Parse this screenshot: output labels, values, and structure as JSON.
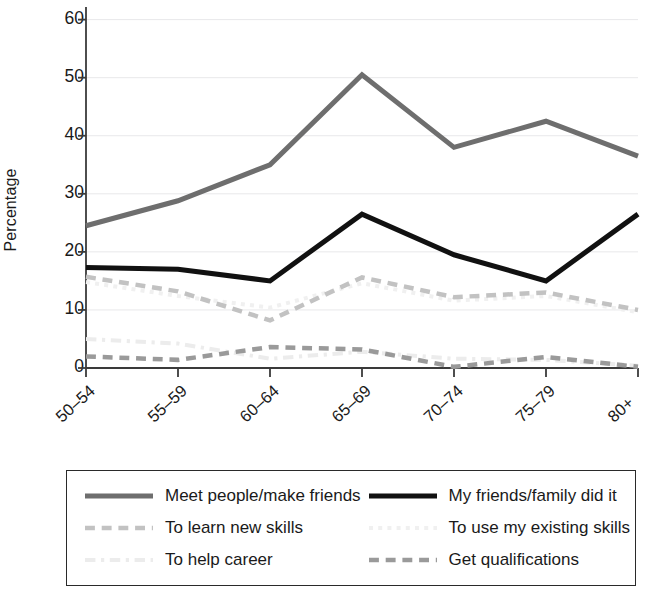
{
  "chart_data": {
    "type": "line",
    "title": "",
    "xlabel": "",
    "ylabel": "Percentage",
    "categories": [
      "50–54",
      "55–59",
      "60–64",
      "65–69",
      "70–74",
      "75–79",
      "80+"
    ],
    "ylim": [
      0,
      62
    ],
    "yticks": [
      0,
      10,
      20,
      30,
      40,
      50,
      60
    ],
    "ytick_labels": [
      "0",
      "10",
      "20",
      "30",
      "40",
      "50",
      "60"
    ],
    "grid": true,
    "grid_axis": "y",
    "legend_position": "bottom",
    "legend_columns": 2,
    "series": [
      {
        "name": "Meet people/make friends",
        "values": [
          24.5,
          28.8,
          35.0,
          50.5,
          38.0,
          42.5,
          36.5
        ],
        "color": "#6e6e6e",
        "style": "solid",
        "width": 5
      },
      {
        "name": "My friends/family did it",
        "values": [
          17.3,
          17.0,
          15.0,
          26.5,
          19.5,
          15.0,
          26.5
        ],
        "color": "#111111",
        "style": "solid",
        "width": 5
      },
      {
        "name": "To learn new skills",
        "values": [
          15.7,
          13.2,
          8.2,
          15.6,
          12.2,
          13.0,
          10.0
        ],
        "color": "#c2c2c2",
        "style": "dashed",
        "width": 4.5
      },
      {
        "name": "To use my existing skills",
        "values": [
          14.8,
          12.4,
          10.4,
          14.6,
          11.6,
          12.4,
          9.6
        ],
        "color": "#f0f0f0",
        "style": "dotted",
        "width": 4
      },
      {
        "name": "To help career",
        "values": [
          5.0,
          4.2,
          1.6,
          2.8,
          1.6,
          1.4,
          0.4
        ],
        "color": "#ececec",
        "style": "dashdot",
        "width": 4
      },
      {
        "name": "Get qualifications",
        "values": [
          2.0,
          1.4,
          3.6,
          3.2,
          0.2,
          1.9,
          0.2
        ],
        "color": "#9a9a9a",
        "style": "dashed",
        "width": 4.5
      }
    ]
  },
  "legend": {
    "items": [
      {
        "label": "Meet people/make friends"
      },
      {
        "label": "My friends/family did it"
      },
      {
        "label": "To learn new skills"
      },
      {
        "label": "To use my existing skills"
      },
      {
        "label": "To help career"
      },
      {
        "label": "Get qualifications"
      }
    ]
  },
  "axes": {
    "y_title": "Percentage"
  }
}
